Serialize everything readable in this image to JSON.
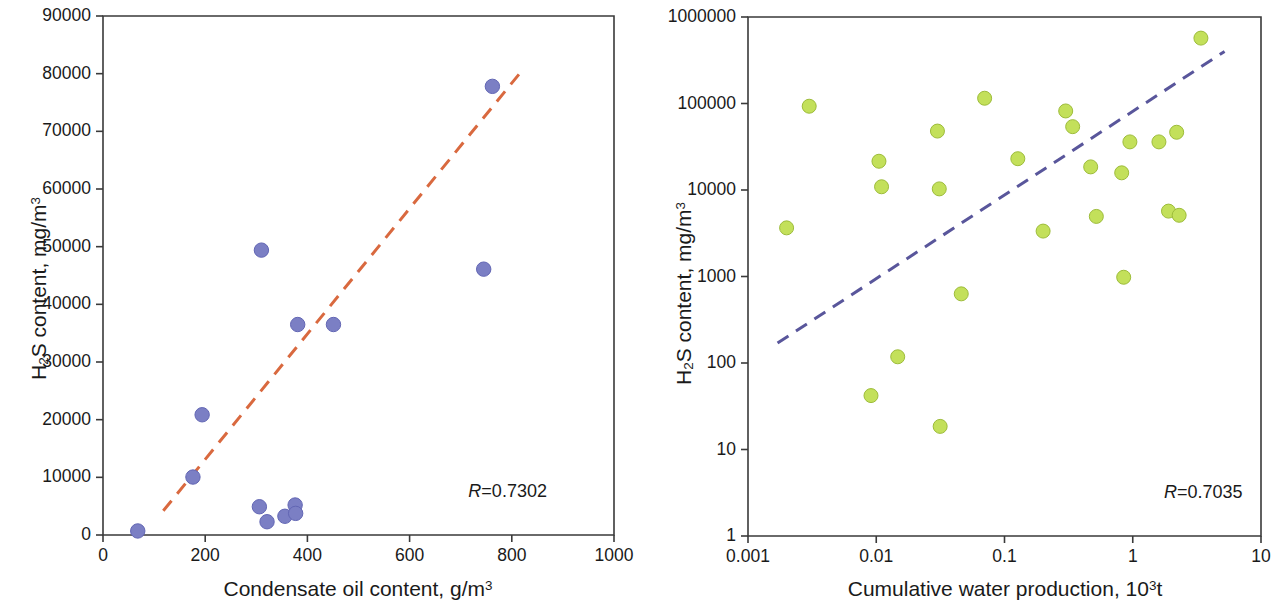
{
  "figure": {
    "background": "#ffffff",
    "width": 1286,
    "height": 606
  },
  "chart_data": [
    {
      "id": "left",
      "type": "scatter",
      "title": "",
      "xlabel": "Condensate oil content, g/m3",
      "xlabel_parts": {
        "text": "Condensate oil content, g/m",
        "sup": "3"
      },
      "ylabel": "H2S content, mg/m3",
      "ylabel_parts": {
        "h": "H",
        "sub1": "2",
        "s": "S content, mg/m",
        "sup": "3"
      },
      "xscale": "linear",
      "yscale": "linear",
      "xlim": [
        0,
        1000
      ],
      "ylim": [
        0,
        90000
      ],
      "xticks": [
        0,
        200,
        400,
        600,
        800,
        1000
      ],
      "xtick_labels": [
        "0",
        "200",
        "400",
        "600",
        "800",
        "1000"
      ],
      "yticks": [
        0,
        10000,
        20000,
        30000,
        40000,
        50000,
        60000,
        70000,
        80000,
        90000
      ],
      "ytick_labels": [
        "0",
        "10000",
        "20000",
        "30000",
        "40000",
        "50000",
        "60000",
        "70000",
        "80000",
        "90000"
      ],
      "grid": false,
      "legend": "none",
      "marker_color": "#7b7fc4",
      "marker_edge_color": "#6266b4",
      "marker_radius": 7.2,
      "points": [
        {
          "x": 68,
          "y": 700
        },
        {
          "x": 176,
          "y": 10050
        },
        {
          "x": 194,
          "y": 20850
        },
        {
          "x": 310,
          "y": 49400
        },
        {
          "x": 306,
          "y": 4900
        },
        {
          "x": 321,
          "y": 2300
        },
        {
          "x": 356,
          "y": 3250
        },
        {
          "x": 376,
          "y": 5200
        },
        {
          "x": 377,
          "y": 3750
        },
        {
          "x": 381,
          "y": 36500
        },
        {
          "x": 451,
          "y": 36500
        },
        {
          "x": 745,
          "y": 46100
        },
        {
          "x": 762,
          "y": 77800
        }
      ],
      "trendline": {
        "style": "dashed",
        "color": "#d9693f",
        "width": 3,
        "x_start": 118,
        "y_start": 4200,
        "x_end": 815,
        "y_end": 80000
      },
      "annotation": {
        "symbol": "R",
        "text": "=0.7302",
        "full": "R=0.7302",
        "x": 715,
        "y": 9200
      }
    },
    {
      "id": "right",
      "type": "scatter",
      "title": "",
      "xlabel": "Cumulative water production, 103t",
      "xlabel_parts": {
        "text": "Cumulative water production, 10",
        "sup": "3",
        "tail": "t"
      },
      "ylabel": "H2S content, mg/m3",
      "ylabel_parts": {
        "h": "H",
        "sub1": "2",
        "s": "S content, mg/m",
        "sup": "3"
      },
      "xscale": "log",
      "yscale": "log",
      "xlim": [
        0.001,
        10
      ],
      "ylim": [
        1,
        1000000
      ],
      "xticks": [
        0.001,
        0.01,
        0.1,
        1,
        10
      ],
      "xtick_labels": [
        "0.001",
        "0.01",
        "0.1",
        "1",
        "10"
      ],
      "yticks": [
        1,
        10,
        100,
        1000,
        10000,
        100000,
        1000000
      ],
      "ytick_labels": [
        "1",
        "10",
        "100",
        "1000",
        "10000",
        "100000",
        "1000000"
      ],
      "grid": false,
      "legend": "none",
      "marker_color": "#c3e05a",
      "marker_edge_color": "#9dbc3a",
      "marker_radius": 7.0,
      "points": [
        {
          "x": 0.002,
          "y": 3650
        },
        {
          "x": 0.003,
          "y": 93000
        },
        {
          "x": 0.0091,
          "y": 42
        },
        {
          "x": 0.0105,
          "y": 21500
        },
        {
          "x": 0.011,
          "y": 10900
        },
        {
          "x": 0.0147,
          "y": 118
        },
        {
          "x": 0.03,
          "y": 48000
        },
        {
          "x": 0.031,
          "y": 10300
        },
        {
          "x": 0.0315,
          "y": 18.5
        },
        {
          "x": 0.046,
          "y": 630
        },
        {
          "x": 0.07,
          "y": 115000
        },
        {
          "x": 0.127,
          "y": 23000
        },
        {
          "x": 0.2,
          "y": 3350
        },
        {
          "x": 0.3,
          "y": 82000
        },
        {
          "x": 0.34,
          "y": 54000
        },
        {
          "x": 0.47,
          "y": 18500
        },
        {
          "x": 0.52,
          "y": 4950
        },
        {
          "x": 0.82,
          "y": 15800
        },
        {
          "x": 0.85,
          "y": 980
        },
        {
          "x": 0.95,
          "y": 36000
        },
        {
          "x": 1.6,
          "y": 36000
        },
        {
          "x": 1.9,
          "y": 5700
        },
        {
          "x": 2.2,
          "y": 46500
        },
        {
          "x": 2.3,
          "y": 5100
        },
        {
          "x": 3.4,
          "y": 570000
        }
      ],
      "trendline": {
        "style": "dashed",
        "color": "#59569b",
        "width": 3,
        "x_start": 0.0017,
        "y_start": 170,
        "x_end": 5.2,
        "y_end": 400000
      },
      "annotation": {
        "symbol": "R",
        "text": "=0.7035",
        "full": "R=0.7035",
        "x": 1.75,
        "y": 4.1
      }
    }
  ],
  "geometry": {
    "left": {
      "plot_x0": 103,
      "plot_x1": 614,
      "plot_y0": 535,
      "plot_y1": 16,
      "xlabel_x": 358,
      "xlabel_y": 578,
      "ylabel_x": 28,
      "ylabel_y": 380
    },
    "right": {
      "plot_x0": 105,
      "plot_x1": 618,
      "plot_y0": 536,
      "plot_y1": 17,
      "xlabel_x": 362,
      "xlabel_y": 578,
      "ylabel_x": 30,
      "ylabel_y": 385
    }
  },
  "style": {
    "axis_color": "#3a3a3a",
    "axis_width": 1.6,
    "tick_length": 7,
    "text_color": "#1a1a1a"
  }
}
